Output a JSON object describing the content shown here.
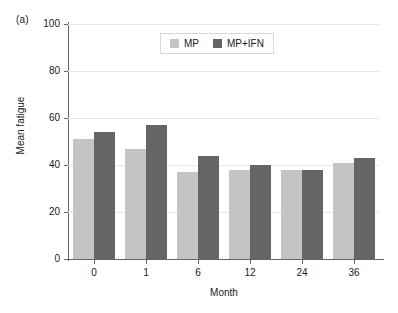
{
  "figure": {
    "panel_label": "(a)"
  },
  "chart_data": {
    "type": "bar",
    "title": "",
    "subtitle": "",
    "xlabel": "Month",
    "ylabel": "Mean fatigue",
    "categories": [
      "0",
      "1",
      "6",
      "12",
      "24",
      "36"
    ],
    "series": [
      {
        "name": "MP",
        "color": "#c4c4c4",
        "values": [
          51,
          47,
          37,
          38,
          38,
          41
        ]
      },
      {
        "name": "MP+IFN",
        "color": "#656565",
        "values": [
          54,
          57,
          44,
          40,
          38,
          43
        ]
      }
    ],
    "ylim": [
      0,
      100
    ],
    "yticks": [
      0,
      20,
      40,
      60,
      80,
      100
    ],
    "ytick_labels": [
      "0",
      "20",
      "40",
      "60",
      "80",
      "100"
    ],
    "grid": "horizontal",
    "grid_color": "#e8e8e8",
    "legend_position": "top-center",
    "legend_entries": [
      "MP",
      "MP+IFN"
    ],
    "axis_color": "#666666",
    "background": "#ffffff"
  }
}
